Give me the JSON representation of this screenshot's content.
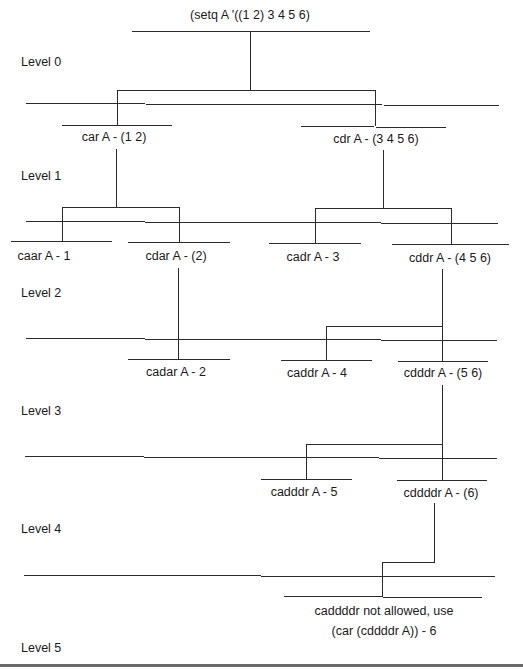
{
  "diagram": {
    "type": "tree",
    "root": {
      "label": "(setq A '((1 2) 3 4 5 6)"
    },
    "levels": [
      {
        "label": "Level 0"
      },
      {
        "label": "Level 1"
      },
      {
        "label": "Level 2"
      },
      {
        "label": "Level 3"
      },
      {
        "label": "Level 4"
      },
      {
        "label": "Level 5"
      }
    ],
    "nodes": {
      "car": {
        "label": "car A - (1 2)"
      },
      "cdr": {
        "label": "cdr A - (3 4 5 6)"
      },
      "caar": {
        "label": "caar A - 1"
      },
      "cdar": {
        "label": "cdar A - (2)"
      },
      "cadr": {
        "label": "cadr A - 3"
      },
      "cddr": {
        "label": "cddr A - (4 5 6)"
      },
      "cadar": {
        "label": "cadar A - 2"
      },
      "caddr": {
        "label": "caddr A - 4"
      },
      "cdddr": {
        "label": "cdddr A - (5 6)"
      },
      "cadddr": {
        "label": "cadddr A - 5"
      },
      "cddddr": {
        "label": "cddddr A - (6)"
      },
      "caddddr_line1": {
        "label": "caddddr not allowed, use"
      },
      "caddddr_line2": {
        "label": "(car (cddddr A)) - 6"
      }
    },
    "edges": [
      [
        "root",
        "car"
      ],
      [
        "root",
        "cdr"
      ],
      [
        "car",
        "caar"
      ],
      [
        "car",
        "cdar"
      ],
      [
        "cdr",
        "cadr"
      ],
      [
        "cdr",
        "cddr"
      ],
      [
        "cdar",
        "cadar"
      ],
      [
        "cddr",
        "caddr"
      ],
      [
        "cddr",
        "cdddr"
      ],
      [
        "cdddr",
        "cadddr"
      ],
      [
        "cdddr",
        "cddddr"
      ],
      [
        "cddddr",
        "caddddr"
      ]
    ]
  }
}
